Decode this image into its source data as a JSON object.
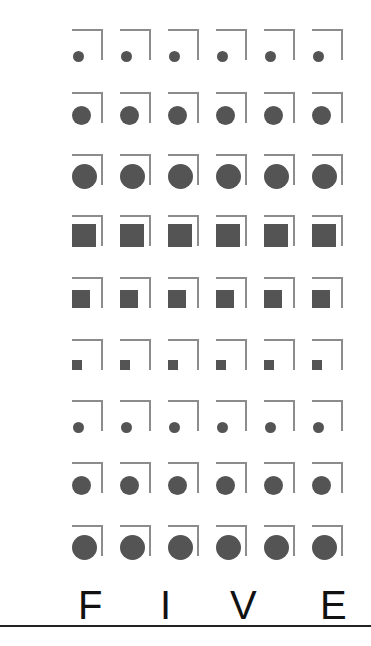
{
  "grid": {
    "columns": 6,
    "column_x": [
      72,
      120,
      168,
      216,
      264,
      312
    ],
    "row_y": [
      29,
      92,
      154,
      215,
      277,
      339,
      400,
      462,
      525
    ],
    "bracket_color": "#8c8c8c",
    "shape_color": "#545454",
    "rows": [
      {
        "shape": "circle",
        "size": "small"
      },
      {
        "shape": "circle",
        "size": "medium"
      },
      {
        "shape": "circle",
        "size": "large"
      },
      {
        "shape": "square",
        "size": "large"
      },
      {
        "shape": "square",
        "size": "medium"
      },
      {
        "shape": "square",
        "size": "small"
      },
      {
        "shape": "circle",
        "size": "small"
      },
      {
        "shape": "circle",
        "size": "medium"
      },
      {
        "shape": "circle",
        "size": "large"
      }
    ]
  },
  "caption": {
    "letters": [
      {
        "char": "F",
        "x": 78
      },
      {
        "char": "I",
        "x": 160
      },
      {
        "char": "V",
        "x": 230
      },
      {
        "char": "E",
        "x": 320
      }
    ],
    "text": "FIVE",
    "color": "#111111"
  },
  "rule_color": "#222222"
}
